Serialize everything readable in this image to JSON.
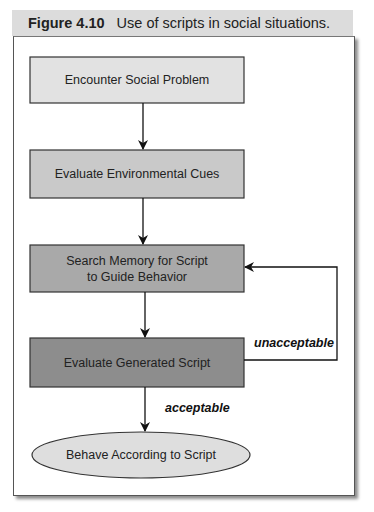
{
  "figure": {
    "number": "Figure 4.10",
    "caption": "Use of scripts in social situations."
  },
  "nodes": [
    {
      "id": "encounter",
      "shape": "rect",
      "lines": [
        "Encounter Social Problem"
      ],
      "fill": "#e2e2e2"
    },
    {
      "id": "evaluate-cues",
      "shape": "rect",
      "lines": [
        "Evaluate Environmental Cues"
      ],
      "fill": "#c9c9c9"
    },
    {
      "id": "search-memory",
      "shape": "rect",
      "lines": [
        "Search Memory for Script",
        "to Guide Behavior"
      ],
      "fill": "#a9a9a9"
    },
    {
      "id": "evaluate-script",
      "shape": "rect",
      "lines": [
        "Evaluate Generated Script"
      ],
      "fill": "#8d8d8d"
    },
    {
      "id": "behave",
      "shape": "ellipse",
      "lines": [
        "Behave According to Script"
      ],
      "fill": "#dedede"
    }
  ],
  "edges": [
    {
      "from": "encounter",
      "to": "evaluate-cues",
      "label": ""
    },
    {
      "from": "evaluate-cues",
      "to": "search-memory",
      "label": ""
    },
    {
      "from": "search-memory",
      "to": "evaluate-script",
      "label": ""
    },
    {
      "from": "evaluate-script",
      "to": "behave",
      "label": "acceptable"
    },
    {
      "from": "evaluate-script",
      "to": "search-memory",
      "label": "unacceptable"
    }
  ],
  "labels": {
    "acceptable": "acceptable",
    "unacceptable": "unacceptable"
  }
}
